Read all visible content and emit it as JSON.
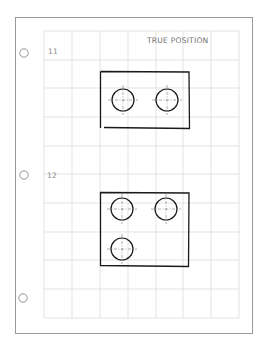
{
  "sheet": {
    "title": "TRUE POSITION",
    "colors": {
      "page_border": "#9a9a9a",
      "grid": "#dcdcdc",
      "drawing": "#1a1a1a",
      "center_lines": "#7a7a7a",
      "punch_hole": "#8a8a8a"
    },
    "punch_holes": [
      {
        "cx": 24,
        "cy": 53
      },
      {
        "cx": 24,
        "cy": 175
      },
      {
        "cx": 23,
        "cy": 298
      }
    ],
    "problems": [
      {
        "number": "11",
        "label_pos": {
          "x": 48,
          "y": 48
        },
        "part": {
          "x": 100,
          "y": 71,
          "width": 89,
          "height": 57
        },
        "holes": [
          {
            "cx": 123,
            "cy": 100,
            "r": 11
          },
          {
            "cx": 167,
            "cy": 100,
            "r": 11
          }
        ]
      },
      {
        "number": "12",
        "label_pos": {
          "x": 47,
          "y": 172
        },
        "part": {
          "x": 100,
          "y": 192,
          "width": 89,
          "height": 74
        },
        "holes": [
          {
            "cx": 122,
            "cy": 209,
            "r": 11
          },
          {
            "cx": 166,
            "cy": 209,
            "r": 11
          },
          {
            "cx": 122,
            "cy": 249,
            "r": 11
          }
        ]
      }
    ]
  }
}
